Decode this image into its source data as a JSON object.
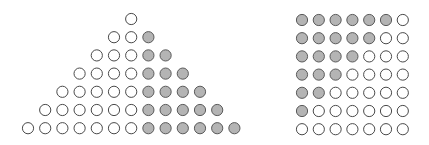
{
  "colors": {
    "white_dot": "#ffffff",
    "gray_dot": "#b4b4b4",
    "outline": "#4a4a4a",
    "background": "#ffffff"
  },
  "triangle": {
    "description": "Triangular arrangement of dots; row n has n white dots followed by n-1 gray dots",
    "rows": [
      {
        "white": 1,
        "gray": 0
      },
      {
        "white": 2,
        "gray": 1
      },
      {
        "white": 3,
        "gray": 2
      },
      {
        "white": 4,
        "gray": 3
      },
      {
        "white": 5,
        "gray": 4
      },
      {
        "white": 6,
        "gray": 5
      },
      {
        "white": 7,
        "gray": 6
      }
    ]
  },
  "square": {
    "description": "7x7 square grid of dots; top row has 6 gray dots, decreasing by one per row",
    "size": 7,
    "rows": [
      {
        "gray": 6,
        "white": 1
      },
      {
        "gray": 5,
        "white": 2
      },
      {
        "gray": 4,
        "white": 3
      },
      {
        "gray": 3,
        "white": 4
      },
      {
        "gray": 2,
        "white": 5
      },
      {
        "gray": 1,
        "white": 6
      },
      {
        "gray": 0,
        "white": 7
      }
    ]
  }
}
